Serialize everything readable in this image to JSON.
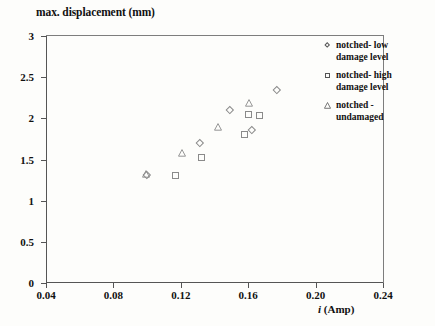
{
  "chart_data": {
    "type": "scatter",
    "title": "",
    "ylabel": "max. displacement (mm)",
    "xlabel": "i (Amp)",
    "xlabel_italic_part": "i",
    "xlabel_rest": " (Amp)",
    "xlim": [
      0.04,
      0.24
    ],
    "ylim": [
      0,
      3
    ],
    "xticks": [
      "0.04",
      "0.08",
      "0.12",
      "0.16",
      "0.20",
      "0.24"
    ],
    "xtick_values": [
      0.04,
      0.08,
      0.12,
      0.16,
      0.2,
      0.24
    ],
    "yticks": [
      "0",
      "0.5",
      "1",
      "1.5",
      "2",
      "2.5",
      "3"
    ],
    "ytick_values": [
      0,
      0.5,
      1,
      1.5,
      2,
      2.5,
      3
    ],
    "grid": false,
    "legend_position": "outside right top",
    "series": [
      {
        "name": "notched- low damage level",
        "marker": "diamond",
        "points": [
          {
            "x": 0.1,
            "y": 1.32
          },
          {
            "x": 0.131,
            "y": 1.7
          },
          {
            "x": 0.149,
            "y": 2.1
          },
          {
            "x": 0.162,
            "y": 1.86
          },
          {
            "x": 0.177,
            "y": 2.35
          }
        ]
      },
      {
        "name": "notched- high damage level",
        "marker": "square",
        "points": [
          {
            "x": 0.117,
            "y": 1.31
          },
          {
            "x": 0.132,
            "y": 1.52
          },
          {
            "x": 0.158,
            "y": 1.8
          },
          {
            "x": 0.16,
            "y": 2.05
          },
          {
            "x": 0.167,
            "y": 2.04
          }
        ]
      },
      {
        "name": "notched - undamaged",
        "marker": "triangle",
        "points": [
          {
            "x": 0.0995,
            "y": 1.4
          },
          {
            "x": 0.121,
            "y": 1.65
          },
          {
            "x": 0.142,
            "y": 1.97
          },
          {
            "x": 0.1605,
            "y": 2.26
          }
        ]
      }
    ]
  },
  "legend": {
    "items": [
      {
        "marker": "diamond",
        "label": "notched- low\ndamage level"
      },
      {
        "marker": "square",
        "label": "notched- high\ndamage level"
      },
      {
        "marker": "triangle",
        "label": "notched -\nundamaged"
      }
    ]
  },
  "colors": {
    "axis": "#555555",
    "frame": "#7d7d7d",
    "marker": "#8a8a8a",
    "text": "#111111",
    "background": "#fdfdfb"
  }
}
